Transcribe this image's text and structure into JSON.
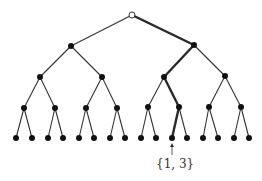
{
  "diagram": {
    "type": "binary-tree",
    "levels": 5,
    "root": {
      "x": 132,
      "y": 15,
      "style": "open"
    },
    "nodes": [
      {
        "id": "L1-0",
        "x": 71,
        "y": 46
      },
      {
        "id": "L1-1",
        "x": 194,
        "y": 45
      },
      {
        "id": "L2-0",
        "x": 40,
        "y": 77
      },
      {
        "id": "L2-1",
        "x": 102,
        "y": 77
      },
      {
        "id": "L2-2",
        "x": 164,
        "y": 77
      },
      {
        "id": "L2-3",
        "x": 225,
        "y": 76
      },
      {
        "id": "L3-0",
        "x": 24,
        "y": 108
      },
      {
        "id": "L3-1",
        "x": 55,
        "y": 108
      },
      {
        "id": "L3-2",
        "x": 86,
        "y": 108
      },
      {
        "id": "L3-3",
        "x": 117,
        "y": 108
      },
      {
        "id": "L3-4",
        "x": 148,
        "y": 107
      },
      {
        "id": "L3-5",
        "x": 179,
        "y": 107
      },
      {
        "id": "L3-6",
        "x": 209,
        "y": 107
      },
      {
        "id": "L3-7",
        "x": 241,
        "y": 107
      }
    ],
    "leaves_y": 138,
    "leaves_x": [
      16,
      32,
      48,
      63,
      79,
      94,
      110,
      125,
      141,
      156,
      172,
      187,
      203,
      218,
      234,
      249
    ],
    "highlighted_path": [
      [
        132,
        15
      ],
      [
        194,
        45
      ],
      [
        164,
        77
      ],
      [
        179,
        107
      ],
      [
        172,
        138
      ]
    ],
    "annotation": {
      "text": "{1, 3}",
      "target_leaf_index": 10,
      "arrow_from": [
        172,
        155
      ],
      "arrow_to": [
        172,
        143
      ]
    }
  }
}
